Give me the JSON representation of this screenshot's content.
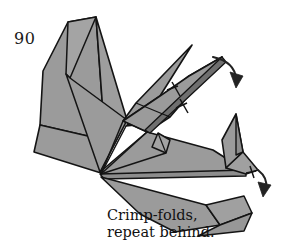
{
  "diagram": {
    "step_number": "90",
    "caption_line_1": "Crimp-folds,",
    "caption_line_2": "repeat behind.",
    "colors": {
      "background": "#ffffff",
      "paper_fill": "#9b9b9b",
      "paper_fill_light": "#a8a8a8",
      "paper_fill_dark": "#8d8d8d",
      "outline": "#141414",
      "arrow": "#222222",
      "text": "#111111"
    },
    "annotations": {
      "arrow_neck_label": "crimp-arrow-neck",
      "arrow_tail_label": "crimp-arrow-tail",
      "tick_marks_count": "2"
    }
  }
}
